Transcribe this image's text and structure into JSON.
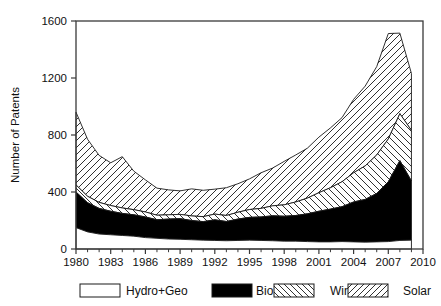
{
  "chart_data": {
    "type": "area",
    "title": "",
    "subtitle": "",
    "xlabel": "",
    "ylabel": "Number of Patents",
    "stacked": true,
    "grid": false,
    "legend_position": "bottom",
    "xlim": [
      1980,
      2010
    ],
    "ylim": [
      0,
      1700
    ],
    "xticks": [
      1980,
      1983,
      1986,
      1989,
      1992,
      1995,
      1998,
      2001,
      2004,
      2007,
      2010
    ],
    "yticks": [
      0,
      400,
      800,
      1200,
      1600
    ],
    "xtick_labels": [
      "1980",
      "1983",
      "1986",
      "1989",
      "1992",
      "1995",
      "1998",
      "2001",
      "2004",
      "2007",
      "2010"
    ],
    "ytick_labels": [
      "0",
      "400",
      "800",
      "1200",
      "1600"
    ],
    "x": [
      1980,
      1981,
      1982,
      1983,
      1984,
      1985,
      1986,
      1987,
      1988,
      1989,
      1990,
      1991,
      1992,
      1993,
      1994,
      1995,
      1996,
      1997,
      1998,
      1999,
      2000,
      2001,
      2002,
      2003,
      2004,
      2005,
      2006,
      2007,
      2008,
      2009
    ],
    "series": [
      {
        "name": "Hydro+Geo",
        "pattern": "empty",
        "fill": "#ffffff",
        "values": [
          150,
          120,
          105,
          100,
          95,
          90,
          80,
          75,
          70,
          68,
          65,
          62,
          60,
          58,
          60,
          62,
          60,
          58,
          55,
          55,
          52,
          50,
          50,
          52,
          50,
          48,
          50,
          52,
          60,
          62
        ]
      },
      {
        "name": "Bio",
        "pattern": "solid",
        "fill": "#000000",
        "values": [
          250,
          205,
          180,
          165,
          155,
          150,
          145,
          130,
          140,
          145,
          135,
          130,
          145,
          135,
          150,
          160,
          165,
          175,
          175,
          180,
          195,
          215,
          230,
          245,
          280,
          300,
          340,
          420,
          560,
          415
        ]
      },
      {
        "name": "Wind",
        "pattern": "backslash",
        "fill": "#ffffff",
        "values": [
          50,
          45,
          42,
          40,
          38,
          36,
          35,
          32,
          30,
          30,
          32,
          35,
          40,
          42,
          48,
          55,
          60,
          70,
          80,
          95,
          110,
          130,
          150,
          175,
          205,
          235,
          270,
          300,
          330,
          355
        ]
      },
      {
        "name": "Solar",
        "pattern": "slash",
        "fill": "#ffffff",
        "values": [
          510,
          400,
          330,
          300,
          360,
          270,
          225,
          190,
          175,
          165,
          190,
          185,
          175,
          195,
          200,
          215,
          250,
          265,
          305,
          330,
          350,
          390,
          420,
          450,
          515,
          560,
          620,
          740,
          565,
          400
        ]
      }
    ],
    "totals": [
      960,
      770,
      657,
      605,
      648,
      546,
      485,
      427,
      415,
      408,
      422,
      412,
      420,
      430,
      458,
      492,
      535,
      568,
      615,
      660,
      707,
      785,
      850,
      922,
      1050,
      1143,
      1280,
      1512,
      1515,
      1232
    ],
    "annotations": []
  },
  "legend": {
    "items": [
      {
        "label": "Hydro+Geo",
        "swatch": "empty"
      },
      {
        "label": "Bio",
        "swatch": "solid"
      },
      {
        "label": "Wind",
        "swatch": "backslash"
      },
      {
        "label": "Solar",
        "swatch": "slash"
      }
    ]
  }
}
